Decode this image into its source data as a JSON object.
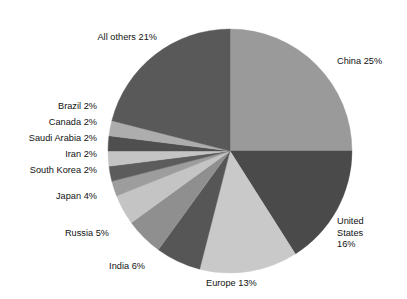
{
  "chart_data": {
    "type": "pie",
    "title": "",
    "subtitle": "",
    "xlabel": "",
    "ylabel": "",
    "legend_position": "none",
    "grid": false,
    "labels_outside": true,
    "unit": "%",
    "start_angle_deg": 0,
    "direction": "clockwise",
    "categories": [
      "China",
      "United States",
      "Europe",
      "India",
      "Russia",
      "Japan",
      "South Korea",
      "Iran",
      "Saudi Arabia",
      "Canada",
      "Brazil",
      "All others"
    ],
    "values": [
      25,
      16,
      13,
      6,
      5,
      4,
      2,
      2,
      2,
      2,
      2,
      21
    ],
    "slices": [
      {
        "name": "China",
        "value": 25,
        "label": "China 25%",
        "color": "#9a9a9a"
      },
      {
        "name": "United States",
        "value": 16,
        "label": "United States 16%",
        "color": "#4a4a4a"
      },
      {
        "name": "Europe",
        "value": 13,
        "label": "Europe 13%",
        "color": "#c9c9c9"
      },
      {
        "name": "India",
        "value": 6,
        "label": "India 6%",
        "color": "#565656"
      },
      {
        "name": "Russia",
        "value": 5,
        "label": "Russia 5%",
        "color": "#8f8f8f"
      },
      {
        "name": "Japan",
        "value": 4,
        "label": "Japan 4%",
        "color": "#c4c4c4"
      },
      {
        "name": "South Korea",
        "value": 2,
        "label": "South Korea 2%",
        "color": "#9d9d9d"
      },
      {
        "name": "Iran",
        "value": 2,
        "label": "Iran 2%",
        "color": "#5c5c5c"
      },
      {
        "name": "Saudi Arabia",
        "value": 2,
        "label": "Saudi Arabia 2%",
        "color": "#c4c4c4"
      },
      {
        "name": "Canada",
        "value": 2,
        "label": "Canada 2%",
        "color": "#4f4f4f"
      },
      {
        "name": "Brazil",
        "value": 2,
        "label": "Brazil 2%",
        "color": "#adadad"
      },
      {
        "name": "All others",
        "value": 21,
        "label": "All others 21%",
        "color": "#595959"
      }
    ]
  },
  "labels": {
    "china": "China 25%",
    "united_states_line1": "United",
    "united_states_line2": "States",
    "united_states_line3": "16%",
    "europe": "Europe 13%",
    "india": "India 6%",
    "russia": "Russia 5%",
    "japan": "Japan 4%",
    "south_korea": "South Korea 2%",
    "iran": "Iran 2%",
    "saudi_arabia": "Saudi Arabia 2%",
    "canada": "Canada 2%",
    "brazil": "Brazil 2%",
    "all_others": "All others 21%"
  },
  "geometry": {
    "center_x": 230,
    "center_y": 151,
    "radius": 122
  },
  "colors": {
    "background": "#ffffff",
    "text": "#111111",
    "slice_light": "#c9c9c9",
    "slice_medium": "#9a9a9a",
    "slice_dark": "#4a4a4a"
  }
}
